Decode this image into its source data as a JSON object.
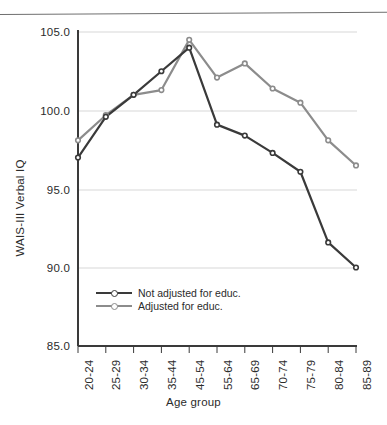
{
  "chart_data": {
    "type": "line",
    "title": "",
    "xlabel": "Age group",
    "ylabel": "WAIS-III Verbal IQ",
    "categories": [
      "20-24",
      "25-29",
      "30-34",
      "35-44",
      "45-54",
      "55-64",
      "65-69",
      "70-74",
      "75-79",
      "80-84",
      "85-89"
    ],
    "ylim": [
      85.0,
      105.0
    ],
    "yticks": [
      "85.0",
      "90.0",
      "95.0",
      "100.0",
      "105.0"
    ],
    "ytick_values": [
      85.0,
      90.0,
      95.0,
      100.0,
      105.0
    ],
    "grid": "horizontal",
    "legend_position": "inside-lower-left",
    "series": [
      {
        "name": "Not adjusted for educ.",
        "color": "#3a3a3a",
        "values": [
          97.0,
          99.6,
          101.0,
          102.5,
          104.0,
          99.1,
          98.4,
          97.3,
          96.1,
          91.6,
          90.0
        ]
      },
      {
        "name": "Adjusted for educ.",
        "color": "#8c8c8c",
        "values": [
          98.1,
          99.7,
          101.0,
          101.3,
          104.5,
          102.1,
          103.0,
          101.4,
          100.5,
          98.1,
          96.5
        ]
      }
    ]
  },
  "legend": {
    "items": [
      {
        "label": "Not adjusted for educ."
      },
      {
        "label": "Adjusted for educ."
      }
    ]
  },
  "axes": {
    "y_title": "WAIS-III Verbal IQ",
    "x_title": "Age group"
  },
  "colors": {
    "series_dark": "#3a3a3a",
    "series_gray": "#8c8c8c",
    "grid": "#d7d7d7",
    "axis": "#3a3a3a",
    "page_rule": "#6f6f6f"
  }
}
